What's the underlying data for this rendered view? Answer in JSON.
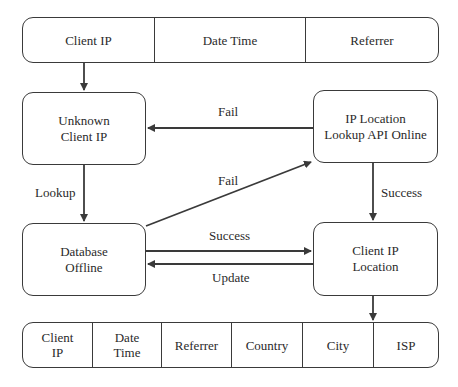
{
  "input_record": {
    "fields": [
      "Client IP",
      "Date Time",
      "Referrer"
    ]
  },
  "nodes": {
    "unknown_client_ip": {
      "line1": "Unknown",
      "line2": "Client IP"
    },
    "ip_location_api": {
      "line1": "IP Location",
      "line2": "Lookup API Online"
    },
    "database": {
      "line1": "Database",
      "line2": "Offline"
    },
    "client_ip_location": {
      "line1": "Client IP",
      "line2": "Location"
    }
  },
  "edges": {
    "api_to_unknown": "Fail",
    "db_to_api": "Fail",
    "unknown_to_db": "Lookup",
    "api_to_location": "Success",
    "db_to_location": "Success",
    "location_to_db": "Update"
  },
  "output_record": {
    "fields": [
      {
        "line1": "Client",
        "line2": "IP"
      },
      {
        "line1": "Date",
        "line2": "Time"
      },
      {
        "line1": "Referrer",
        "line2": ""
      },
      {
        "line1": "Country",
        "line2": ""
      },
      {
        "line1": "City",
        "line2": ""
      },
      {
        "line1": "ISP",
        "line2": ""
      }
    ]
  },
  "colors": {
    "stroke": "#3a3a3a",
    "text": "#2a2a2a",
    "background": "#ffffff"
  }
}
